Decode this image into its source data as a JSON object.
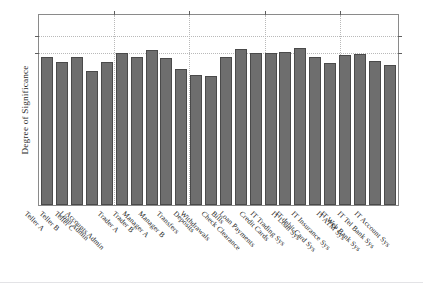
{
  "chart_data": {
    "type": "bar",
    "title": "",
    "subtitle": "",
    "xlabel": "",
    "ylabel": "Degree of Significance",
    "ylim": [
      0,
      1.12
    ],
    "grid": "horizontal and vertical dotted gridlines; no numeric y tick labels",
    "legend": "none",
    "axis_tick_labels": {
      "y": [],
      "x_rotation_degrees": 45
    },
    "gridlines": {
      "horizontal_values": [
        1.0,
        0.9
      ],
      "vertical_after_categories": [
        5,
        10,
        15,
        20
      ]
    },
    "categories": [
      "Teller A",
      "Teller B",
      "Teller C",
      "Loan Admin",
      "Accounts Admin",
      "Trader A",
      "Trader B",
      "Manager A",
      "Manager B",
      "Transfers",
      "Deposits",
      "Withdrawals",
      "Bills",
      "Check Clearance",
      "Loan Payments",
      "Credit Cards",
      "IT Trading Sys",
      "IT Loan Sys",
      "IT debit Card Sys",
      "IT Insurance Sys",
      "IT ATM Sys",
      "IT Web Bank Sys",
      "IT Tel Bank Sys",
      "IT Account Sys"
    ],
    "values": [
      0.863,
      0.837,
      0.863,
      0.784,
      0.837,
      0.889,
      0.863,
      0.902,
      0.856,
      0.791,
      0.758,
      0.752,
      0.863,
      0.908,
      0.889,
      0.889,
      0.895,
      0.915,
      0.863,
      0.83,
      0.876,
      0.882,
      0.843,
      0.817
    ],
    "colors": {
      "bar_fill": "#6e6e6e",
      "bar_edge": "#4a4a4a",
      "axis": "#8a8a8a",
      "grid": "#b9b9b9",
      "text": "#262626",
      "background": "#ffffff"
    }
  }
}
